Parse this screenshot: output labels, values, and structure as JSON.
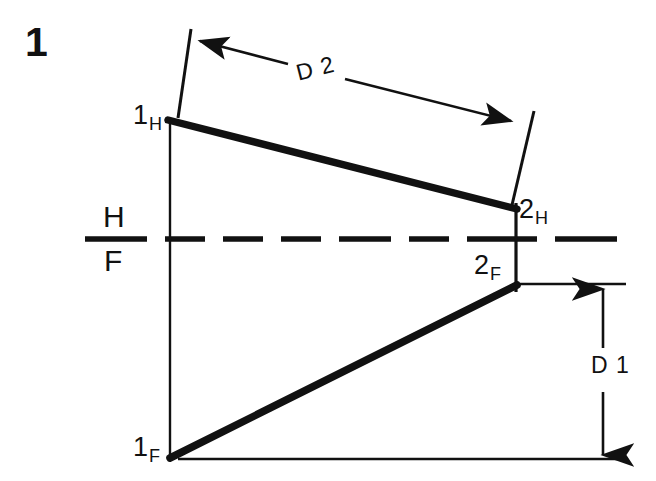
{
  "figure": {
    "number": "1",
    "type": "descriptive-geometry-orthographic-projection",
    "width": 656,
    "height": 481,
    "background_color": "#ffffff",
    "ink_color": "#111111"
  },
  "reference_line": {
    "upper_label": "H",
    "lower_label": "F",
    "style": "dashed",
    "y": 239,
    "x_start": 85,
    "x_end": 632
  },
  "points": [
    {
      "key": "1H",
      "main": "1",
      "sub": "H",
      "x": 168,
      "y": 120,
      "label_x": 133,
      "label_y": 102
    },
    {
      "key": "2H",
      "main": "2",
      "sub": "H",
      "x": 516,
      "y": 208,
      "label_x": 519,
      "label_y": 196
    },
    {
      "key": "2F",
      "main": "2",
      "sub": "F",
      "x": 516,
      "y": 286,
      "label_x": 474,
      "label_y": 252
    },
    {
      "key": "1F",
      "main": "1",
      "sub": "F",
      "x": 170,
      "y": 458,
      "label_x": 133,
      "label_y": 434
    }
  ],
  "lines": [
    {
      "name": "top-view-line",
      "from": "1H",
      "to": "2H",
      "weight": "thick"
    },
    {
      "name": "front-view-line",
      "from": "1F",
      "to": "2F",
      "weight": "thick"
    }
  ],
  "dimensions": [
    {
      "key": "D2",
      "label": "D 2",
      "orientation": "inclined",
      "label_x": 291,
      "label_y": 63,
      "arrow_start": {
        "x": 196,
        "y": 40
      },
      "arrow_end": {
        "x": 516,
        "y": 122
      }
    },
    {
      "key": "D1",
      "label": "D 1",
      "orientation": "vertical",
      "label_x": 588,
      "label_y": 354,
      "arrow_start": {
        "x": 603,
        "y": 288
      },
      "arrow_end": {
        "x": 603,
        "y": 456
      }
    }
  ],
  "projection_lines": [
    {
      "name": "left-projector",
      "x": 170,
      "y_top": 122,
      "y_bottom": 458
    },
    {
      "name": "right-projector",
      "x": 516,
      "y_top": 203,
      "y_bottom": 292
    }
  ],
  "extension_lines": [
    {
      "name": "d2-left-extension",
      "x1": 191,
      "y1": 29,
      "x2": 178,
      "y2": 118
    },
    {
      "name": "d2-right-extension",
      "x1": 534,
      "y1": 111,
      "x2": 512,
      "y2": 204
    },
    {
      "name": "d1-upper-extension",
      "x1": 520,
      "y1": 284,
      "x2": 626,
      "y2": 284
    },
    {
      "name": "d1-lower-extension",
      "x1": 178,
      "y1": 459,
      "x2": 626,
      "y2": 459
    }
  ]
}
